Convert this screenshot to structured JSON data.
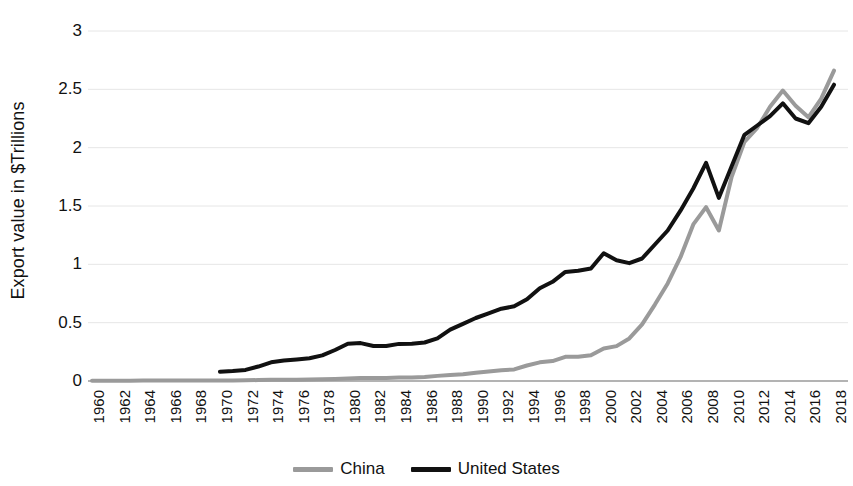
{
  "chart_data": {
    "type": "line",
    "title": "",
    "xlabel": "",
    "ylabel": "Export value in $Trillions",
    "xlim": [
      1960,
      2018
    ],
    "ylim": [
      0,
      3
    ],
    "yticks": [
      "0",
      "0.5",
      "1",
      "1.5",
      "2",
      "2.5",
      "3"
    ],
    "ytick_values": [
      0,
      0.5,
      1,
      1.5,
      2,
      2.5,
      3
    ],
    "grid": "horizontal",
    "legend_position": "bottom-center",
    "xticks": [
      "1960",
      "1962",
      "1964",
      "1966",
      "1968",
      "1970",
      "1972",
      "1974",
      "1976",
      "1978",
      "1980",
      "1982",
      "1984",
      "1986",
      "1988",
      "1990",
      "1992",
      "1994",
      "1996",
      "1998",
      "2000",
      "2002",
      "2004",
      "2006",
      "2008",
      "2010",
      "2012",
      "2014",
      "2016",
      "2018"
    ],
    "x": [
      1960,
      1961,
      1962,
      1963,
      1964,
      1965,
      1966,
      1967,
      1968,
      1969,
      1970,
      1971,
      1972,
      1973,
      1974,
      1975,
      1976,
      1977,
      1978,
      1979,
      1980,
      1981,
      1982,
      1983,
      1984,
      1985,
      1986,
      1987,
      1988,
      1989,
      1990,
      1991,
      1992,
      1993,
      1994,
      1995,
      1996,
      1997,
      1998,
      1999,
      2000,
      2001,
      2002,
      2003,
      2004,
      2005,
      2006,
      2007,
      2008,
      2009,
      2010,
      2011,
      2012,
      2013,
      2014,
      2015,
      2016,
      2017,
      2018
    ],
    "series": [
      {
        "name": "China",
        "color": "#9a9a9a",
        "values": [
          0.003,
          0.003,
          0.003,
          0.003,
          0.004,
          0.004,
          0.004,
          0.004,
          0.004,
          0.004,
          0.005,
          0.005,
          0.006,
          0.008,
          0.01,
          0.011,
          0.011,
          0.012,
          0.014,
          0.018,
          0.022,
          0.025,
          0.025,
          0.026,
          0.029,
          0.031,
          0.034,
          0.044,
          0.052,
          0.057,
          0.071,
          0.082,
          0.093,
          0.099,
          0.133,
          0.16,
          0.171,
          0.207,
          0.207,
          0.22,
          0.279,
          0.299,
          0.365,
          0.485,
          0.655,
          0.836,
          1.061,
          1.342,
          1.49,
          1.29,
          1.75,
          2.05,
          2.17,
          2.35,
          2.49,
          2.36,
          2.26,
          2.42,
          2.66
        ]
      },
      {
        "name": "United States",
        "color": "#111111",
        "values": [
          null,
          null,
          null,
          null,
          null,
          null,
          null,
          null,
          null,
          null,
          0.08,
          0.085,
          0.095,
          0.124,
          0.16,
          0.175,
          0.185,
          0.195,
          0.22,
          0.266,
          0.32,
          0.325,
          0.3,
          0.3,
          0.318,
          0.32,
          0.33,
          0.365,
          0.44,
          0.49,
          0.54,
          0.58,
          0.62,
          0.64,
          0.7,
          0.795,
          0.85,
          0.935,
          0.945,
          0.965,
          1.095,
          1.035,
          1.01,
          1.05,
          1.17,
          1.29,
          1.46,
          1.65,
          1.87,
          1.57,
          1.84,
          2.11,
          2.19,
          2.27,
          2.38,
          2.25,
          2.21,
          2.35,
          2.54
        ]
      }
    ]
  },
  "legend": {
    "entries": [
      {
        "label": "China",
        "color": "#9a9a9a"
      },
      {
        "label": "United States",
        "color": "#111111"
      }
    ]
  }
}
